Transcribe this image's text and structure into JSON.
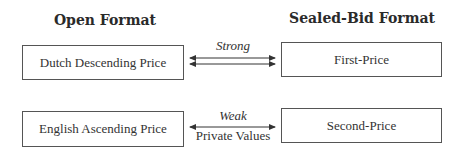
{
  "headings": {
    "open": "Open Format",
    "sealed": "Sealed-Bid Format"
  },
  "rows": [
    {
      "left": "Dutch Descending Price",
      "right": "First-Price",
      "relation_above": "Strong",
      "relation_below": "",
      "arrows": "two double-headed arrows"
    },
    {
      "left": "English Ascending Price",
      "right": "Second-Price",
      "relation_above": "Weak",
      "relation_below": "Private Values",
      "arrows": "one double-headed arrow"
    }
  ],
  "colors": {
    "line": "#555555",
    "text": "#333333"
  }
}
